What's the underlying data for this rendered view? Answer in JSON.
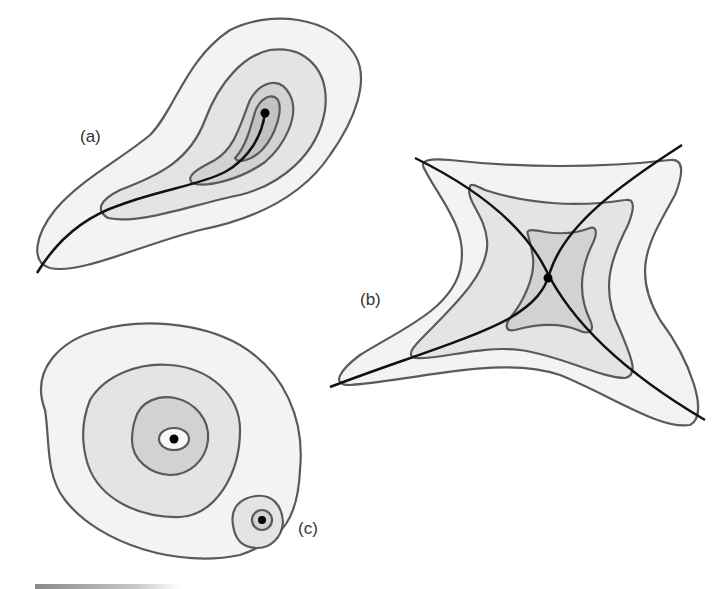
{
  "figure": {
    "panels": [
      {
        "id": "a",
        "label": "(a)",
        "kind": "elongated teardrop contours with a curve ending at a point"
      },
      {
        "id": "b",
        "label": "(b)",
        "kind": "four-pointed star contours with two crossing curves (saddle)"
      },
      {
        "id": "c",
        "label": "(c)",
        "kind": "nested round contours with central point and a small secondary basin"
      }
    ],
    "colors": {
      "outline": "#5a5a5a",
      "curve": "#111111",
      "fill_level_1": "#f3f3f3",
      "fill_level_2": "#e4e4e4",
      "fill_level_3": "#d2d2d2",
      "fill_level_4": "#c2c2c2",
      "point": "#000000"
    }
  }
}
